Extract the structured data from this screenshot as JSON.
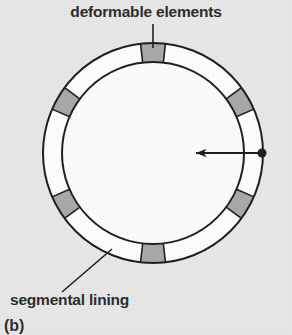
{
  "figure": {
    "caption": "(b)",
    "background_color": "#e9e9e9",
    "labels": {
      "top": "deformable elements",
      "bottom": "segmental lining"
    },
    "colors": {
      "lining_fill": "#ffffff",
      "segment_fill": "#a9a9a9",
      "outline": "#1d1d1d",
      "inner_area": "#fdfdfd",
      "text": "#2b2b2b"
    },
    "ring": {
      "center_x": 153,
      "center_y": 153,
      "outer_radius": 110,
      "inner_radius": 91,
      "stroke_width": 2
    },
    "deformable_elements": {
      "count": 6,
      "angles_deg": [
        90,
        150,
        210,
        270,
        330,
        30
      ],
      "angular_width_deg": 13
    },
    "arrow": {
      "name": "radial-load-arrow",
      "from_x": 262,
      "from_y": 153,
      "to_x": 196,
      "to_y": 153,
      "dot_radius": 4.5,
      "direction": "inward"
    },
    "leaders": [
      {
        "name": "deformable-elements-leader",
        "x1": 153,
        "y1": 24,
        "x2": 153,
        "y2": 48
      },
      {
        "name": "segmental-lining-leader",
        "x1": 62,
        "y1": 292,
        "x2": 112,
        "y2": 249
      }
    ]
  }
}
